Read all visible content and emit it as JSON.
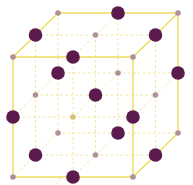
{
  "diagram": {
    "title": "",
    "type": "crystal-lattice-unit-cell",
    "colors": {
      "background": "#ffffff",
      "edge_solid": "#ecdc5a",
      "edge_dashed": "#f0e69a",
      "large_ion": "#5b1b4c",
      "small_ion": "#b09096",
      "hidden_small_ion": "#d8c07a"
    },
    "geometry": {
      "front_origin": [
        13,
        57
      ],
      "front_size": 120,
      "depth_step": [
        22.5,
        -22
      ]
    },
    "large_ion_radius": 6.8,
    "small_ion_radius": 2.8
  }
}
